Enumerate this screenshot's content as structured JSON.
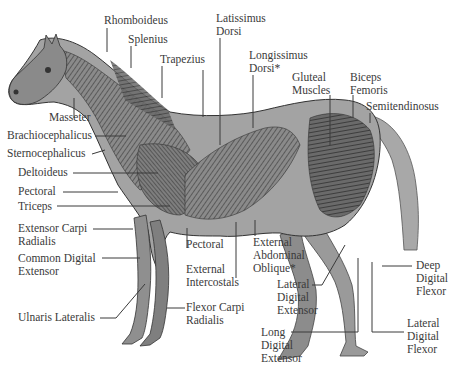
{
  "diagram": {
    "colors": {
      "background": "#ffffff",
      "body_fill": "#9c9c9c",
      "muscle_dark": "#4a4a4a",
      "muscle_mid": "#7a7a7a",
      "skin_light": "#c4c4c4",
      "leader_line": "#3a3a3a",
      "label_text": "#3a3a3a"
    },
    "labels": {
      "rhomboideus": "Rhomboideus",
      "splenius": "Splenius",
      "trapezius": "Trapezius",
      "latissimus_dorsi": "Latissimus\nDorsi",
      "longissimus_dorsi": "Longissimus\nDorsi*",
      "gluteal_muscles": "Gluteal\nMuscles",
      "biceps_femoris": "Biceps\nFemoris",
      "semitendinosus": "Semitendinosus",
      "masseter": "Masseter",
      "brachiocephalicus": "Brachiocephalicus",
      "sternocephalicus": "Sternocephalicus",
      "deltoideus": "Deltoideus",
      "pectoral_left": "Pectoral",
      "triceps": "Triceps",
      "extensor_carpi_radialis": "Extensor Carpi\nRadialis",
      "common_digital_extensor": "Common Digital\nExtensor",
      "ulnaris_lateralis": "Ulnaris Lateralis",
      "pectoral_bottom": "Pectoral",
      "external_intercostals": "External\nIntercostals",
      "flexor_carpi_radialis": "Flexor Carpi\nRadialis",
      "external_abdominal_oblique": "External\nAbdominal\nOblique*",
      "lateral_digital_extensor": "Lateral\nDigital\nExtensor",
      "long_digital_extensor": "Long\nDigital\nExtensor",
      "deep_digital_flexor": "Deep\nDigital\nFlexor",
      "lateral_digital_flexor": "Lateral\nDigital\nFlexor"
    }
  }
}
